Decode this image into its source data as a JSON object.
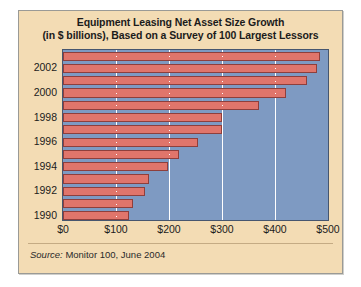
{
  "figure": {
    "title_line1": "Equipment Leasing Net Asset Size Growth",
    "title_line2": "(in $ billions), Based on a Survey of 100 Largest Lessors",
    "source_label": "Source:",
    "source_text": "Monitor 100, June 2004",
    "colors": {
      "background": "#f3dcb4",
      "plot_background": "#7e9ac2",
      "bar_fill": "#e0756b",
      "bar_border": "#8e3f3c",
      "gridline": "#ffffff",
      "frame": "#9a9a96"
    }
  },
  "chart_data": {
    "type": "bar",
    "orientation": "horizontal",
    "title": "Equipment Leasing Net Asset Size Growth (in $ billions), Based on a Survey of 100 Largest Lessors",
    "xlabel": "",
    "ylabel": "",
    "xlim": [
      0,
      500
    ],
    "grid": true,
    "legend": null,
    "xticks": [
      0,
      100,
      200,
      300,
      400,
      500
    ],
    "xtick_labels": [
      "$0",
      "$100",
      "$200",
      "$300",
      "$400",
      "$500"
    ],
    "ytick_labels": [
      "1990",
      "1992",
      "1994",
      "1996",
      "1998",
      "2000",
      "2002"
    ],
    "categories": [
      "1990",
      "1991",
      "1992",
      "1993",
      "1994",
      "1995",
      "1996",
      "1997",
      "1998",
      "1999",
      "2000",
      "2001",
      "2002",
      "2003"
    ],
    "values": [
      125,
      133,
      155,
      163,
      198,
      218,
      255,
      300,
      300,
      370,
      420,
      460,
      480,
      484
    ],
    "bars": [
      {
        "year": "2003",
        "value": 484,
        "labeled": false
      },
      {
        "year": "2002",
        "value": 480,
        "labeled": true
      },
      {
        "year": "2001",
        "value": 460,
        "labeled": false
      },
      {
        "year": "2000",
        "value": 420,
        "labeled": true
      },
      {
        "year": "1999",
        "value": 370,
        "labeled": false
      },
      {
        "year": "1998",
        "value": 300,
        "labeled": true
      },
      {
        "year": "1997",
        "value": 300,
        "labeled": false
      },
      {
        "year": "1996",
        "value": 255,
        "labeled": true
      },
      {
        "year": "1995",
        "value": 218,
        "labeled": false
      },
      {
        "year": "1994",
        "value": 198,
        "labeled": true
      },
      {
        "year": "1993",
        "value": 163,
        "labeled": false
      },
      {
        "year": "1992",
        "value": 155,
        "labeled": true
      },
      {
        "year": "1991",
        "value": 133,
        "labeled": false
      },
      {
        "year": "1990",
        "value": 125,
        "labeled": true
      }
    ]
  }
}
